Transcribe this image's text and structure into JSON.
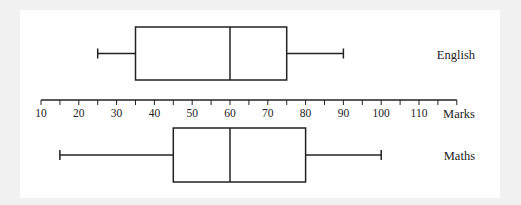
{
  "chart_data": {
    "type": "boxplot",
    "title": "",
    "xlabel": "Marks",
    "ylabel": "",
    "xlim": [
      10,
      120
    ],
    "ticks": {
      "major": [
        10,
        20,
        30,
        40,
        50,
        60,
        70,
        80,
        90,
        100,
        110
      ],
      "minor_step": 5
    },
    "tick_labels": [
      "10",
      "20",
      "30",
      "40",
      "50",
      "60",
      "70",
      "80",
      "90",
      "100",
      "110"
    ],
    "grid": false,
    "series": [
      {
        "name": "English",
        "min": 25,
        "q1": 35,
        "median": 60,
        "q3": 75,
        "max": 90
      },
      {
        "name": "Maths",
        "min": 15,
        "q1": 45,
        "median": 60,
        "q3": 80,
        "max": 100
      }
    ]
  },
  "colors": {
    "line": "#222222",
    "panel": "#ffffff",
    "background": "#f1f1f1"
  }
}
